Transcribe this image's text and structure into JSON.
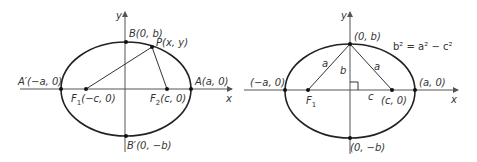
{
  "diagrams": [
    {
      "id": "left",
      "axes": {
        "x_label": "x",
        "y_label": "y"
      },
      "points": {
        "B": "B(0, b)",
        "P": "P(x, y)",
        "A_prime": "A′(−a, 0)",
        "A": "A(a, 0)",
        "F1_label": "F",
        "F1_sub": "1",
        "F1_coord": "(−c, 0)",
        "F2_label": "F",
        "F2_sub": "2",
        "F2_coord": "(c, 0)",
        "B_prime": "B′(0, −b)"
      }
    },
    {
      "id": "right",
      "axes": {
        "x_label": "x",
        "y_label": "y"
      },
      "points": {
        "top": "(0, b)",
        "left": "(−a, 0)",
        "right": "(a, 0)",
        "F1_label": "F",
        "F1_sub": "1",
        "focus_right": "(c, 0)",
        "bottom": "(0, −b)"
      },
      "segments": {
        "a_left": "a",
        "a_right": "a",
        "b": "b",
        "c": "c"
      },
      "equation": "b² = a² − c²"
    }
  ]
}
